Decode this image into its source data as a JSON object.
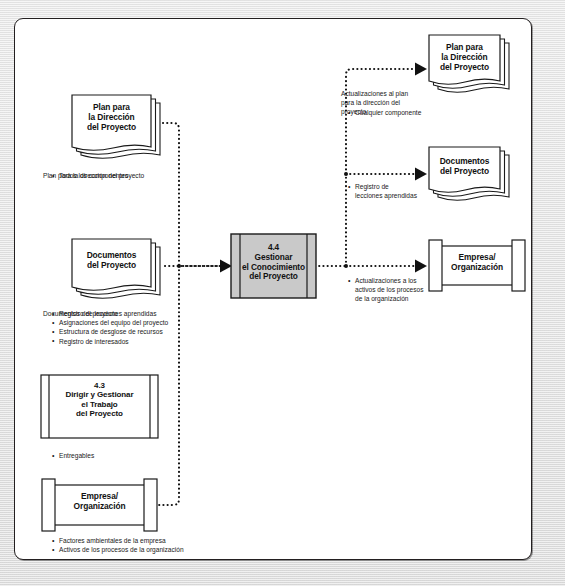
{
  "diagram": {
    "process": {
      "number": "4.4",
      "line1": "Gestionar",
      "line2": "el Conocimiento",
      "line3": "del Proyecto",
      "fill": "#c9c9c9"
    },
    "inputs": [
      {
        "id": "plan-direccion-proyecto",
        "shape": "document-stack",
        "title_lines": [
          "Plan para",
          "la Dirección",
          "del Proyecto"
        ],
        "caption": "Plan para la dirección del proyecto",
        "bullets": [
          "Todos los componentes"
        ]
      },
      {
        "id": "documentos-proyecto",
        "shape": "document-stack",
        "title_lines": [
          "Documentos",
          "del Proyecto"
        ],
        "caption": "Documentos del proyecto",
        "bullets": [
          "Registro de lecciones aprendidas",
          "Asignaciones del equipo del proyecto",
          "Estructura de desglose de recursos",
          "Registro de interesados"
        ]
      },
      {
        "id": "dirigir-gestionar-trabajo",
        "shape": "process-box",
        "title_lines": [
          "4.3",
          "Dirigir y Gestionar",
          "el Trabajo",
          "del Proyecto"
        ],
        "caption": "",
        "bullets": [
          "Entregables"
        ]
      },
      {
        "id": "empresa-organizacion-entrada",
        "shape": "data-store",
        "title_lines": [
          "Empresa/",
          "Organización"
        ],
        "caption": "",
        "bullets": [
          "Factores ambientales de la empresa",
          "Activos de los procesos de la organización"
        ]
      }
    ],
    "outputs": [
      {
        "id": "plan-direccion-proyecto-salida",
        "shape": "document-stack",
        "title_lines": [
          "Plan para",
          "la Dirección",
          "del Proyecto"
        ],
        "caption": "Actualizaciones al plan para la dirección del proyecto",
        "bullets": [
          "Cualquier componente"
        ]
      },
      {
        "id": "documentos-proyecto-salida",
        "shape": "document-stack",
        "title_lines": [
          "Documentos",
          "del Proyecto"
        ],
        "caption": "",
        "bullets": [
          "Registro de lecciones aprendidas"
        ]
      },
      {
        "id": "empresa-organizacion-salida",
        "shape": "data-store",
        "title_lines": [
          "Empresa/",
          "Organización"
        ],
        "caption": "",
        "bullets": [
          "Actualizaciones a los activos de los procesos de la organización"
        ]
      }
    ],
    "annotations": {
      "in_plan_caption": "Plan para la dirección del proyecto",
      "in_plan_b1": "Todos los componentes",
      "in_docs_caption": "Documentos del proyecto",
      "in_docs_b1": "Registro de lecciones aprendidas",
      "in_docs_b2": "Asignaciones del equipo del proyecto",
      "in_docs_b3": "Estructura de desglose de recursos",
      "in_docs_b4": "Registro de interesados",
      "in_43_b1": "Entregables",
      "in_emp_b1": "Factores ambientales de la empresa",
      "in_emp_b2": "Activos de los procesos de la organización",
      "out_plan_caption": "Actualizaciones al plan\npara la dirección del\nproyecto",
      "out_plan_b1": "Cualquier componente",
      "out_docs_b1": "Registro de\nlecciones aprendidas",
      "out_emp_b1": "Actualizaciones a los\nactivos de los procesos\nde la organización"
    },
    "style": {
      "line_color": "#111111",
      "stroke": "#1a1a1a",
      "paper": "#ffffff",
      "page_bg": "#e9e9e9"
    }
  }
}
